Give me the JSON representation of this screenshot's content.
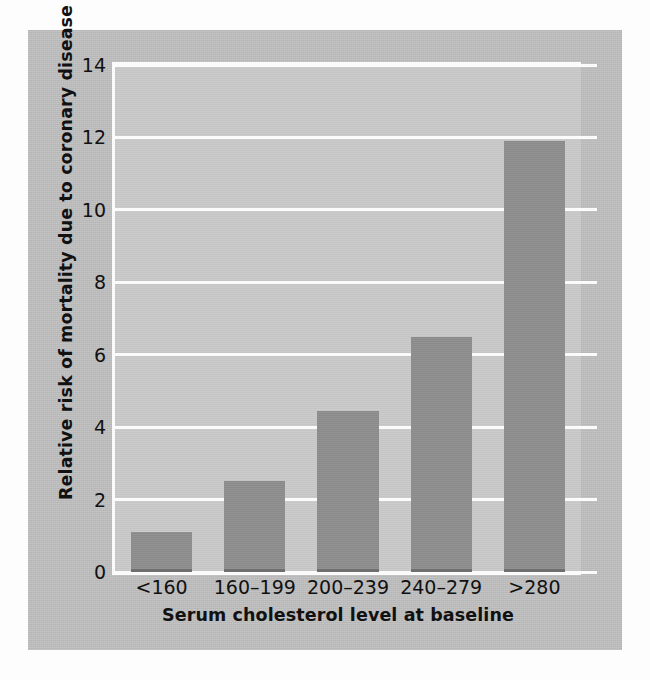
{
  "chart_data": {
    "type": "bar",
    "title": "",
    "subtitle": "",
    "xlabel": "Serum cholesterol level at baseline",
    "ylabel": "Relative risk of mortality due to coronary disease",
    "categories": [
      "<160",
      "160–199",
      "200–239",
      "240–279",
      ">280"
    ],
    "values": [
      1.1,
      2.5,
      4.45,
      6.5,
      11.9
    ],
    "ylim": [
      0,
      14
    ],
    "yticks": [
      0,
      2,
      4,
      6,
      8,
      10,
      12,
      14
    ],
    "ytick_labels": [
      "0",
      "2",
      "4",
      "6",
      "8",
      "10",
      "12",
      "14"
    ],
    "grid": true,
    "grid_axis": "y",
    "grid_color": "#fbfbfb",
    "legend": false,
    "legend_position": "none",
    "orientation": "vertical",
    "series": [
      {
        "name": "Relative risk of mortality due to coronary disease",
        "values": [
          1.1,
          2.5,
          4.45,
          6.5,
          11.9
        ]
      }
    ]
  },
  "figure": {
    "panel_background": "#bfbfbf",
    "plot_background": "#c9c9c9",
    "bar_color": "#8e8e8e",
    "bar_shadow_color": "#6f6f6f",
    "text_color": "#111111",
    "page_background": "#fdfdfd"
  }
}
